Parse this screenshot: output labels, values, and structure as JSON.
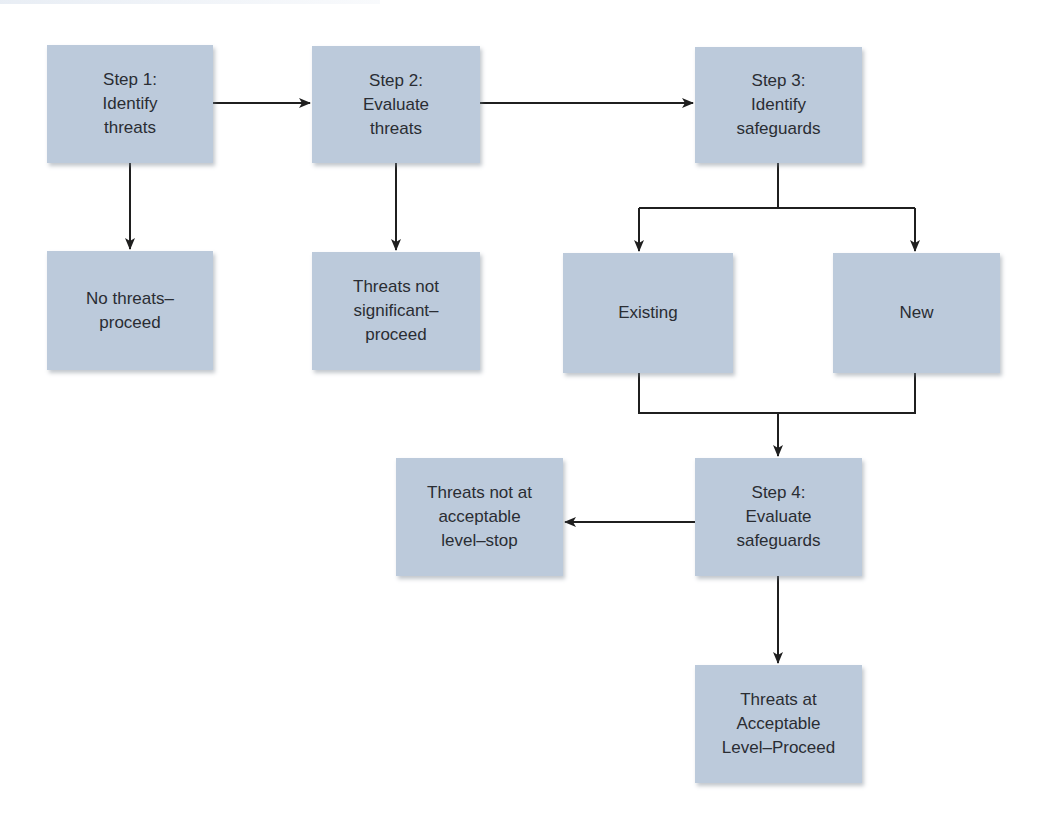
{
  "diagram": {
    "colors": {
      "box_fill": "#bccadb",
      "text": "#2a2d33",
      "connector": "#1f1f1f"
    },
    "nodes": [
      {
        "id": "step1",
        "label": "Step 1:\nIdentify\nthreats",
        "x": 47,
        "y": 45,
        "w": 166,
        "h": 118
      },
      {
        "id": "step2",
        "label": "Step 2:\nEvaluate\nthreats",
        "x": 312,
        "y": 46,
        "w": 168,
        "h": 117
      },
      {
        "id": "step3",
        "label": "Step 3:\nIdentify\nsafeguards",
        "x": 695,
        "y": 47,
        "w": 167,
        "h": 116
      },
      {
        "id": "no_threats",
        "label": "No threats–\nproceed",
        "x": 47,
        "y": 251,
        "w": 166,
        "h": 119
      },
      {
        "id": "not_significant",
        "label": "Threats not\nsignificant–\nproceed",
        "x": 312,
        "y": 252,
        "w": 168,
        "h": 118
      },
      {
        "id": "existing",
        "label": "Existing",
        "x": 563,
        "y": 253,
        "w": 170,
        "h": 120
      },
      {
        "id": "new",
        "label": "New",
        "x": 833,
        "y": 253,
        "w": 167,
        "h": 120
      },
      {
        "id": "not_acceptable",
        "label": "Threats not at\nacceptable\nlevel–stop",
        "x": 396,
        "y": 458,
        "w": 167,
        "h": 118
      },
      {
        "id": "step4",
        "label": "Step 4:\nEvaluate\nsafeguards",
        "x": 695,
        "y": 458,
        "w": 167,
        "h": 118
      },
      {
        "id": "acceptable",
        "label": "Threats at\nAcceptable\nLevel–Proceed",
        "x": 695,
        "y": 665,
        "w": 167,
        "h": 118
      }
    ],
    "edges": [
      {
        "from": "step1",
        "to": "step2",
        "points": [
          [
            213,
            103
          ],
          [
            310,
            103
          ]
        ],
        "arrow": true
      },
      {
        "from": "step2",
        "to": "step3",
        "points": [
          [
            480,
            103
          ],
          [
            693,
            103
          ]
        ],
        "arrow": true
      },
      {
        "from": "step1",
        "to": "no_threats",
        "points": [
          [
            130,
            163
          ],
          [
            130,
            249
          ]
        ],
        "arrow": true
      },
      {
        "from": "step2",
        "to": "not_significant",
        "points": [
          [
            396,
            163
          ],
          [
            396,
            250
          ]
        ],
        "arrow": true
      },
      {
        "from": "step3",
        "to": "branch",
        "points": [
          [
            778,
            163
          ],
          [
            778,
            208
          ]
        ],
        "arrow": false
      },
      {
        "from": "branch",
        "to": "existing",
        "points": [
          [
            639,
            208
          ],
          [
            639,
            251
          ]
        ],
        "arrow": true
      },
      {
        "from": "branch",
        "to": "new",
        "points": [
          [
            915,
            208
          ],
          [
            915,
            251
          ]
        ],
        "arrow": true
      },
      {
        "from": "branch_bar",
        "to": "branch_bar",
        "points": [
          [
            639,
            208
          ],
          [
            915,
            208
          ]
        ],
        "arrow": false
      },
      {
        "from": "existing",
        "to": "merge",
        "points": [
          [
            639,
            373
          ],
          [
            639,
            413
          ],
          [
            778,
            413
          ]
        ],
        "arrow": false
      },
      {
        "from": "new",
        "to": "merge",
        "points": [
          [
            915,
            373
          ],
          [
            915,
            413
          ],
          [
            778,
            413
          ]
        ],
        "arrow": false
      },
      {
        "from": "merge",
        "to": "step4",
        "points": [
          [
            778,
            413
          ],
          [
            778,
            456
          ]
        ],
        "arrow": true
      },
      {
        "from": "step4",
        "to": "not_acceptable",
        "points": [
          [
            695,
            522
          ],
          [
            565,
            522
          ]
        ],
        "arrow": true
      },
      {
        "from": "step4",
        "to": "acceptable",
        "points": [
          [
            778,
            576
          ],
          [
            778,
            663
          ]
        ],
        "arrow": true
      }
    ]
  }
}
